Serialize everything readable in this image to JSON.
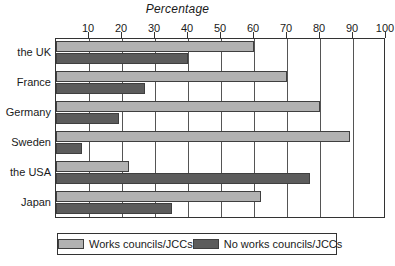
{
  "chart_data": {
    "type": "bar",
    "title": "Percentage",
    "xlabel": "",
    "ylabel": "",
    "orientation": "horizontal",
    "xlim": [
      0,
      100
    ],
    "grid": true,
    "legend_position": "bottom",
    "xticks": [
      0,
      10,
      20,
      30,
      40,
      50,
      60,
      70,
      80,
      90,
      100
    ],
    "xtick_labels": [
      "",
      "10",
      "20",
      "30",
      "40",
      "50",
      "60",
      "70",
      "80",
      "90",
      "100"
    ],
    "categories": [
      "the UK",
      "France",
      "Germany",
      "Sweden",
      "the USA",
      "Japan"
    ],
    "series": [
      {
        "name": "Works councils/JCCs",
        "color": "#b2b2b2",
        "values": [
          60,
          70,
          80,
          89,
          22,
          62
        ]
      },
      {
        "name": "No works councils/JCCs",
        "color": "#5c5c5c",
        "values": [
          40,
          27,
          19,
          8,
          77,
          35
        ]
      }
    ]
  },
  "legend": {
    "entries": [
      {
        "label": "Works councils/JCCs"
      },
      {
        "label": "No works councils/JCCs"
      }
    ]
  }
}
